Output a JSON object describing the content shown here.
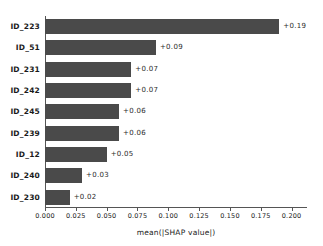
{
  "chart_data": {
    "type": "bar",
    "orientation": "horizontal",
    "title": "",
    "xlabel": "mean(|SHAP value|)",
    "ylabel": "",
    "categories": [
      "ID_223",
      "ID_51",
      "ID_231",
      "ID_242",
      "ID_245",
      "ID_239",
      "ID_12",
      "ID_240",
      "ID_230"
    ],
    "values": [
      0.19,
      0.09,
      0.07,
      0.07,
      0.06,
      0.06,
      0.05,
      0.03,
      0.02
    ],
    "value_labels": [
      "+0.19",
      "+0.09",
      "+0.07",
      "+0.07",
      "+0.06",
      "+0.06",
      "+0.05",
      "+0.03",
      "+0.02"
    ],
    "xlim": [
      0.0,
      0.2125
    ],
    "xticks": [
      0.0,
      0.025,
      0.05,
      0.075,
      0.1,
      0.125,
      0.15,
      0.175,
      0.2
    ],
    "xtick_labels": [
      "0.000",
      "0.025",
      "0.050",
      "0.075",
      "0.100",
      "0.125",
      "0.150",
      "0.175",
      "0.200"
    ],
    "grid": false,
    "legend": null,
    "bar_color": "#4a4a4a",
    "axis_color": "#555555",
    "text_color": "#1a1a1a"
  }
}
